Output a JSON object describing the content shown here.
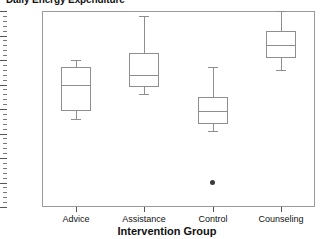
{
  "chart_data": {
    "type": "box",
    "title": "Daily Energy Expenditure",
    "xlabel": "Intervention Group",
    "ylabel": "",
    "categories": [
      "Advice",
      "Assistance",
      "Control",
      "Counseling"
    ],
    "ylim": [
      28,
      36
    ],
    "yticks": [
      28,
      29,
      30,
      31,
      32,
      33,
      34,
      35,
      36
    ],
    "ytick_labels": [
      "28",
      "29",
      "30",
      "31",
      "32",
      "33",
      "34",
      "35",
      "36"
    ],
    "minor_ticks_per_interval": 5,
    "grid": false,
    "legend": "none",
    "boxes": [
      {
        "category": "Advice",
        "whisker_low": 31.6,
        "q1": 31.9,
        "median": 33.0,
        "q3": 33.7,
        "whisker_high": 34.0,
        "outliers": []
      },
      {
        "category": "Assistance",
        "whisker_low": 32.6,
        "q1": 32.9,
        "median": 33.4,
        "q3": 34.3,
        "whisker_high": 35.8,
        "outliers": []
      },
      {
        "category": "Control",
        "whisker_low": 31.1,
        "q1": 31.4,
        "median": 31.9,
        "q3": 32.5,
        "whisker_high": 33.7,
        "outliers": [
          29.0
        ]
      },
      {
        "category": "Counseling",
        "whisker_low": 33.6,
        "q1": 34.1,
        "median": 34.6,
        "q3": 35.2,
        "whisker_high": 36.0,
        "outliers": []
      }
    ],
    "colors": {
      "box_stroke": "#8e8e8e",
      "axis": "#9a9a9a",
      "outlier": "#3a3a3a",
      "text": "#111111",
      "background": "#ffffff"
    }
  }
}
